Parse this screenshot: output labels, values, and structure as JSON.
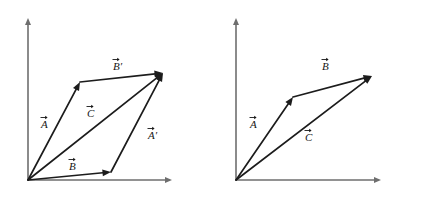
{
  "figure": {
    "background_color": "#ffffff",
    "vector_color": "#1c1c1c",
    "axis_color": "#6e6e6e",
    "label_color": "#161616"
  },
  "panels": [
    {
      "id": "left-panel",
      "name": "parallelogram-method-panel",
      "axes": {
        "origin": [
          28,
          180
        ],
        "y_tip": [
          28,
          18
        ],
        "x_tip": [
          172,
          180
        ]
      },
      "vectors": [
        {
          "name": "vector-A",
          "label": "A",
          "prime": false,
          "from": [
            28,
            180
          ],
          "to": [
            80,
            82
          ],
          "label_pos": [
            41,
            128
          ]
        },
        {
          "name": "vector-B-prime",
          "label": "B",
          "prime": true,
          "from": [
            80,
            82
          ],
          "to": [
            163,
            73
          ],
          "label_pos": [
            113,
            70
          ]
        },
        {
          "name": "vector-B",
          "label": "B",
          "prime": false,
          "from": [
            28,
            180
          ],
          "to": [
            111,
            172
          ],
          "label_pos": [
            69,
            170
          ]
        },
        {
          "name": "vector-A-prime",
          "label": "A",
          "prime": true,
          "from": [
            111,
            172
          ],
          "to": [
            163,
            73
          ],
          "label_pos": [
            148,
            139
          ]
        },
        {
          "name": "vector-C-resultant",
          "label": "C",
          "prime": false,
          "from": [
            28,
            180
          ],
          "to": [
            163,
            73
          ],
          "label_pos": [
            87,
            117
          ]
        }
      ]
    },
    {
      "id": "right-panel",
      "name": "triangle-method-panel",
      "axes": {
        "origin": [
          236,
          180
        ],
        "y_tip": [
          236,
          18
        ],
        "x_tip": [
          381,
          180
        ]
      },
      "vectors": [
        {
          "name": "vector-A",
          "label": "A",
          "prime": false,
          "from": [
            236,
            180
          ],
          "to": [
            293,
            97
          ],
          "label_pos": [
            250,
            128
          ]
        },
        {
          "name": "vector-B",
          "label": "B",
          "prime": false,
          "from": [
            293,
            97
          ],
          "to": [
            372,
            76
          ],
          "label_pos": [
            322,
            70
          ]
        },
        {
          "name": "vector-C-resultant",
          "label": "C",
          "prime": false,
          "from": [
            236,
            180
          ],
          "to": [
            372,
            76
          ],
          "label_pos": [
            305,
            141
          ]
        }
      ]
    }
  ]
}
